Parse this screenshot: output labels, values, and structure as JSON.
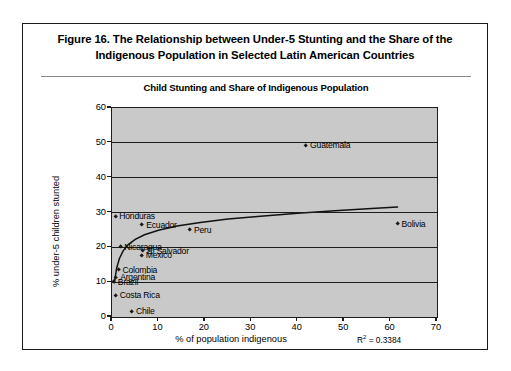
{
  "figure": {
    "caption_line1": "Figure 16.  The Relationship between Under-5 Stunting and the Share of the",
    "caption_line2": "Indigenous Population in Selected Latin American Countries"
  },
  "chart_data": {
    "type": "scatter",
    "title": "Child Stunting and Share of Indigenous Population",
    "xlabel": "% of population indigenous",
    "ylabel": "% under-5 children stunted",
    "xlim": [
      0,
      70
    ],
    "ylim": [
      0,
      60
    ],
    "xticks": [
      "0",
      "10",
      "20",
      "30",
      "40",
      "50",
      "60",
      "70"
    ],
    "yticks": [
      "0",
      "10",
      "20",
      "30",
      "40",
      "50",
      "60"
    ],
    "grid": "horizontal",
    "legend": "none",
    "annotation": "R2 = 0.3384",
    "annotation_base": "R",
    "annotation_sup": "2",
    "annotation_value": " = 0.3384",
    "r_squared": 0.3384,
    "plot_background": "#c9c9c9",
    "marker_color": "#1a1a1a",
    "trendline_color": "#111111",
    "points": [
      {
        "name": "Guatemala",
        "x": 41.8,
        "y": 49.3,
        "label_side": "right"
      },
      {
        "name": "Bolivia",
        "x": 61.5,
        "y": 26.8,
        "label_side": "right"
      },
      {
        "name": "Honduras",
        "x": 0.7,
        "y": 28.9,
        "label_side": "right"
      },
      {
        "name": "Ecuador",
        "x": 6.5,
        "y": 26.4,
        "label_side": "right"
      },
      {
        "name": "Peru",
        "x": 16.8,
        "y": 25.1,
        "label_side": "right"
      },
      {
        "name": "Nicaragua",
        "x": 1.8,
        "y": 20.2,
        "label_side": "right"
      },
      {
        "name": "El Salvador",
        "x": 6.7,
        "y": 19.0,
        "label_side": "right"
      },
      {
        "name": "Mexico",
        "x": 6.4,
        "y": 17.7,
        "label_side": "right"
      },
      {
        "name": "Colombia",
        "x": 1.4,
        "y": 13.5,
        "label_side": "right"
      },
      {
        "name": "Argentina",
        "x": 0.9,
        "y": 11.4,
        "label_side": "right"
      },
      {
        "name": "Brazil",
        "x": 0.4,
        "y": 10.0,
        "label_side": "right"
      },
      {
        "name": "Costa Rica",
        "x": 0.8,
        "y": 6.2,
        "label_side": "right"
      },
      {
        "name": "Chile",
        "x": 4.3,
        "y": 1.6,
        "label_side": "right"
      }
    ],
    "trendline": {
      "description": "logarithmic best fit curve",
      "points": [
        {
          "x": 0.5,
          "y": 9.8
        },
        {
          "x": 1.0,
          "y": 14.0
        },
        {
          "x": 1.6,
          "y": 16.8
        },
        {
          "x": 2.4,
          "y": 19.0
        },
        {
          "x": 3.5,
          "y": 20.8
        },
        {
          "x": 5.0,
          "y": 22.3
        },
        {
          "x": 7.0,
          "y": 23.6
        },
        {
          "x": 10.0,
          "y": 24.9
        },
        {
          "x": 14.0,
          "y": 26.1
        },
        {
          "x": 19.0,
          "y": 27.1
        },
        {
          "x": 25.0,
          "y": 28.1
        },
        {
          "x": 32.0,
          "y": 28.9
        },
        {
          "x": 40.0,
          "y": 29.8
        },
        {
          "x": 48.0,
          "y": 30.5
        },
        {
          "x": 55.0,
          "y": 31.1
        },
        {
          "x": 61.5,
          "y": 31.6
        }
      ]
    }
  }
}
